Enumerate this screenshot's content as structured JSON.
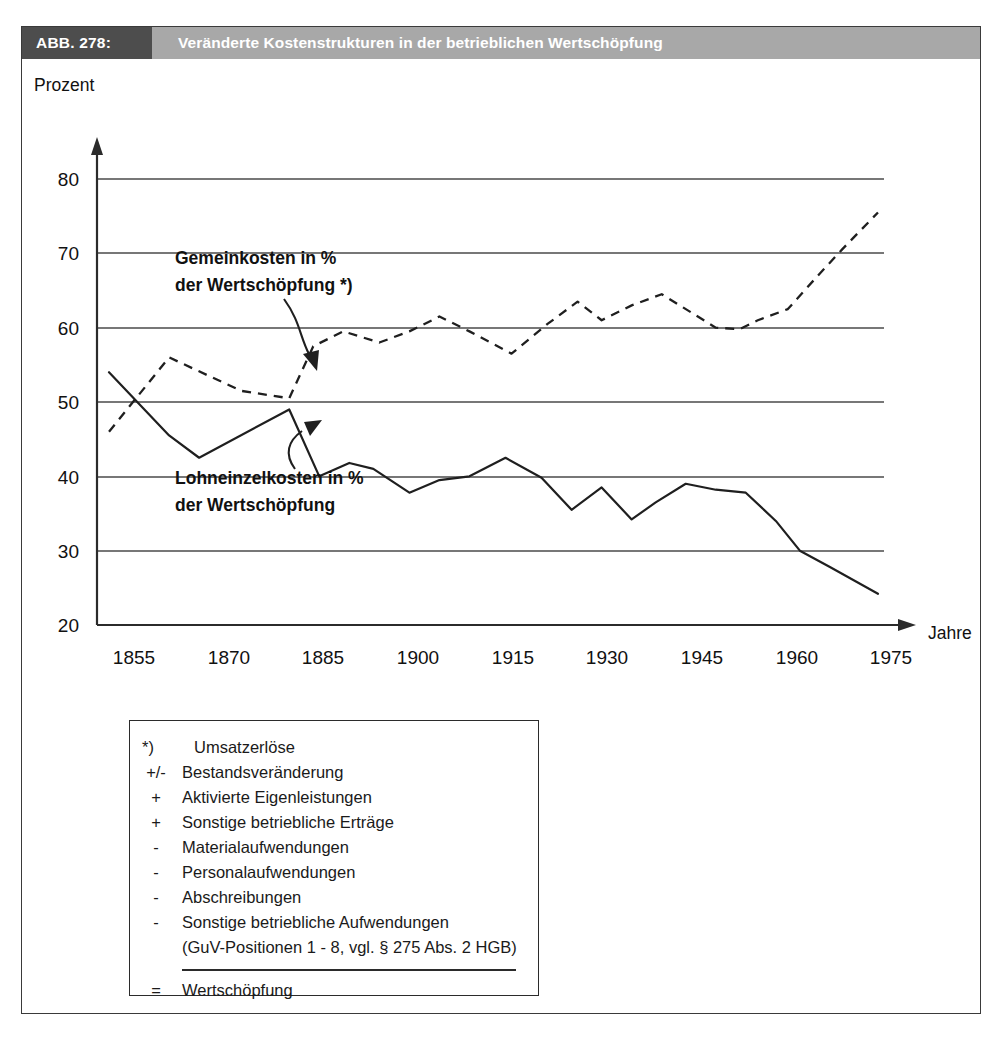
{
  "figure": {
    "number_label": "ABB. 278:",
    "title": "Veränderte Kostenstrukturen in der betrieblichen Wertschöpfung"
  },
  "chart_data": {
    "type": "line",
    "title": "Veränderte Kostenstrukturen in der betrieblichen Wertschöpfung",
    "xlabel": "Jahre",
    "ylabel": "Prozent",
    "xlim": [
      1848,
      1982
    ],
    "ylim": [
      20,
      85
    ],
    "grid": true,
    "legend_position": "inline-annotations",
    "x_ticks": [
      1855,
      1870,
      1885,
      1900,
      1915,
      1930,
      1945,
      1960,
      1975
    ],
    "y_ticks": [
      20,
      30,
      40,
      50,
      60,
      70,
      80
    ],
    "series": [
      {
        "name": "Gemeinkosten in % der Wertschöpfung *)",
        "style": "dashed",
        "x": [
          1850,
          1860,
          1872,
          1880,
          1884,
          1889,
          1895,
          1900,
          1905,
          1910,
          1917,
          1923,
          1928,
          1932,
          1937,
          1942,
          1947,
          1951,
          1955,
          1958,
          1963,
          1968,
          1972,
          1978
        ],
        "y": [
          46.0,
          56.0,
          51.5,
          50.5,
          57.5,
          59.5,
          58.0,
          59.5,
          61.5,
          59.5,
          56.5,
          60.5,
          63.5,
          61.0,
          63.0,
          64.5,
          62.0,
          60.0,
          59.8,
          61.0,
          62.5,
          67.0,
          70.5,
          75.5
        ]
      },
      {
        "name": "Lohneinzelkosten in % der Wertschöpfung",
        "style": "solid",
        "x": [
          1850,
          1860,
          1865,
          1880,
          1885,
          1890,
          1894,
          1900,
          1905,
          1910,
          1916,
          1922,
          1927,
          1932,
          1937,
          1941,
          1946,
          1951,
          1956,
          1961,
          1965,
          1970,
          1978
        ],
        "y": [
          54.0,
          45.5,
          42.5,
          49.0,
          40.0,
          41.8,
          41.0,
          37.8,
          39.5,
          40.0,
          42.5,
          39.8,
          35.5,
          38.5,
          34.2,
          36.5,
          39.0,
          38.2,
          37.8,
          34.0,
          30.0,
          27.8,
          24.2
        ]
      }
    ],
    "annotations": [
      {
        "id": "gemeinkosten",
        "lines": [
          "Gemeinkosten in %",
          "der Wertschöpfung *)"
        ],
        "points_to": "dashed series"
      },
      {
        "id": "lohneinzelkosten",
        "lines": [
          "Lohneinzelkosten in %",
          "der Wertschöpfung"
        ],
        "points_to": "solid series"
      }
    ]
  },
  "footnote": {
    "rows": [
      {
        "sign": "*)",
        "text": "Umsatzerlöse"
      },
      {
        "sign": "+/-",
        "text": "Bestandsveränderung"
      },
      {
        "sign": "+",
        "text": "Aktivierte Eigenleistungen"
      },
      {
        "sign": "+",
        "text": "Sonstige betriebliche Erträge"
      },
      {
        "sign": "-",
        "text": "Materialaufwendungen"
      },
      {
        "sign": "-",
        "text": "Personalaufwendungen"
      },
      {
        "sign": "-",
        "text": "Abschreibungen"
      },
      {
        "sign": "-",
        "text": "Sonstige betriebliche Aufwendungen"
      }
    ],
    "sub_line": "(GuV-Positionen 1 - 8, vgl. § 275 Abs. 2 HGB)",
    "total": {
      "sign": "=",
      "text": "Wertschöpfung"
    }
  },
  "colors": {
    "number_bg": "#4d4d4d",
    "title_bg": "#a8a8a8",
    "ink": "#1f1f1f",
    "frame": "#3a3a3a"
  }
}
